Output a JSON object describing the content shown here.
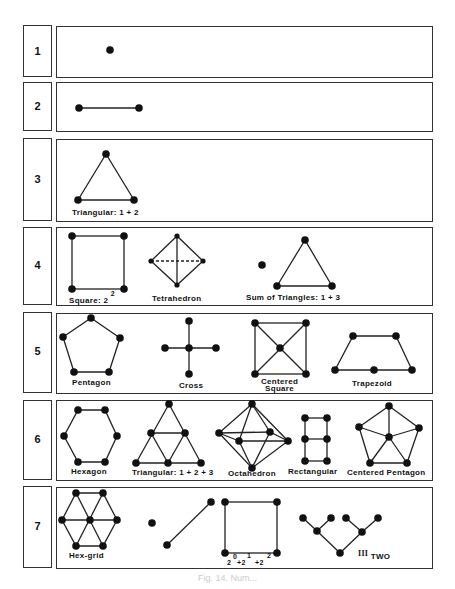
{
  "rows": [
    {
      "number": "1",
      "figures": []
    },
    {
      "number": "2",
      "figures": []
    },
    {
      "number": "3",
      "figures": [
        {
          "label": "Triangular: 1 + 2"
        }
      ]
    },
    {
      "number": "4",
      "figures": [
        {
          "label": "Square: 2",
          "sup": "2"
        },
        {
          "label": "Tetrahedron"
        },
        {
          "label": "Sum of Triangles: 1 + 3"
        }
      ]
    },
    {
      "number": "5",
      "figures": [
        {
          "label": "Pentagon"
        },
        {
          "label": "Cross"
        },
        {
          "label": "Centered",
          "label2": "Square"
        },
        {
          "label": "Trapezoid"
        }
      ]
    },
    {
      "number": "6",
      "figures": [
        {
          "label": "Hexagon"
        },
        {
          "label": "Triangular: 1 + 2 + 3"
        },
        {
          "label": "Octahedron"
        },
        {
          "label": "Rectangular"
        },
        {
          "label": "Centered Pentagon"
        }
      ]
    },
    {
      "number": "7",
      "figures": [
        {
          "label": "Hex-grid"
        },
        {
          "label": "",
          "binary": {
            "base_a": "2",
            "exp_a": "0",
            "plus_b": "+2",
            "exp_b": "1",
            "plus_c": "+2",
            "exp_c": "2"
          }
        },
        {
          "label": "III",
          "sub": "TWO"
        }
      ]
    }
  ],
  "caption": "Fig. 14. Num..."
}
